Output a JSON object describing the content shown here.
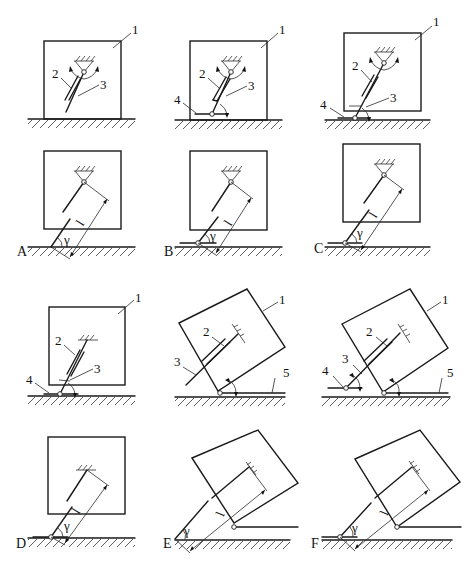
{
  "figure": {
    "part_labels": {
      "body": "1",
      "strut_tube": "2",
      "strut_rod": "3",
      "ground_pivot_plate": "4",
      "ground_rail": "5"
    },
    "geometry_labels": {
      "length": "l",
      "angle": "γ"
    },
    "panels": [
      {
        "id": "A",
        "label": "A",
        "callouts": [
          "1",
          "2",
          "3"
        ],
        "length": "l",
        "angle": "γ"
      },
      {
        "id": "B",
        "label": "B",
        "callouts": [
          "1",
          "2",
          "3",
          "4"
        ],
        "length": "l",
        "angle": "γ"
      },
      {
        "id": "C",
        "label": "C",
        "callouts": [
          "1",
          "2",
          "3",
          "4"
        ],
        "length": "l",
        "angle": "γ"
      },
      {
        "id": "D",
        "label": "D",
        "callouts": [
          "1",
          "2",
          "3",
          "4"
        ],
        "length": "l",
        "angle": "γ"
      },
      {
        "id": "E",
        "label": "E",
        "callouts": [
          "1",
          "2",
          "3",
          "5"
        ],
        "length": "l",
        "angle": "γ"
      },
      {
        "id": "F",
        "label": "F",
        "callouts": [
          "1",
          "2",
          "3",
          "4",
          "5"
        ],
        "length": "l",
        "angle": "γ"
      }
    ]
  }
}
